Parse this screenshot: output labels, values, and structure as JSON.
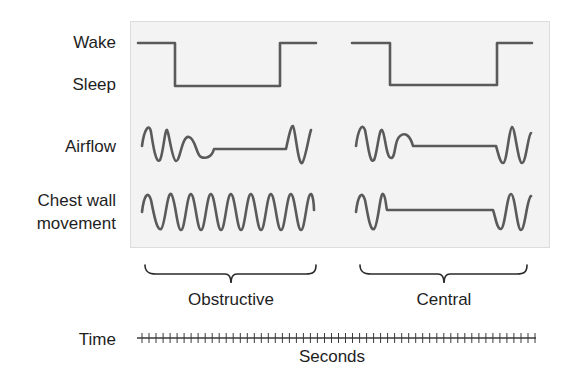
{
  "row_labels": {
    "wake": "Wake",
    "sleep": "Sleep",
    "airflow": "Airflow",
    "chest_line1": "Chest wall",
    "chest_line2": "movement",
    "time": "Time"
  },
  "groups": {
    "obstructive": "Obstructive",
    "central": "Central"
  },
  "axis": {
    "unit_label": "Seconds",
    "tick_count": 57
  },
  "colors": {
    "trace": "#5a5a5a",
    "panel_bg": "#f3f3f3",
    "text": "#1e1e1e"
  },
  "chart_data": {
    "type": "line",
    "title": "",
    "panels": [
      {
        "name": "Obstructive",
        "series": [
          {
            "name": "Wake/Sleep",
            "shape": "step: wake -> sleep -> wake"
          },
          {
            "name": "Airflow",
            "shape": "oscillation (2.5 cycles), diminishing, flat (absent), then resumes (1 cycle)"
          },
          {
            "name": "Chest wall movement",
            "shape": "continuous oscillation (~9 cycles), never stops"
          }
        ]
      },
      {
        "name": "Central",
        "series": [
          {
            "name": "Wake/Sleep",
            "shape": "step: wake -> sleep -> wake"
          },
          {
            "name": "Airflow",
            "shape": "oscillation (2.5 cycles), diminishing, flat (absent), then resumes (2 cycles)"
          },
          {
            "name": "Chest wall movement",
            "shape": "oscillation (2 cycles), flat (absent), then resumes (2 cycles)"
          }
        ]
      }
    ],
    "xlabel": "Seconds",
    "ylabel": "",
    "grid": false,
    "legend": "row labels on left"
  }
}
